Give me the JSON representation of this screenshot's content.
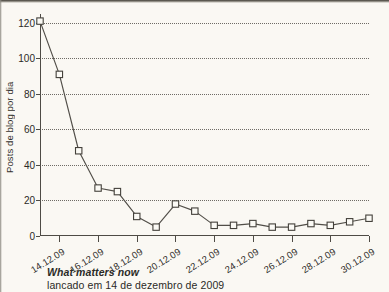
{
  "chart_data": {
    "type": "line",
    "title": "",
    "xlabel": "",
    "ylabel": "Posts de blog por dia",
    "ylim": [
      0,
      125
    ],
    "yticks": [
      0,
      20,
      40,
      60,
      80,
      100,
      120
    ],
    "ytick_labels": [
      "0",
      "20",
      "40",
      "60",
      "80",
      "100",
      "120"
    ],
    "grid": "horizontal dotted at y ticks",
    "legend": "none",
    "marker": "open square",
    "categories": [
      "13.12.09",
      "14.12.09",
      "15.12.09",
      "16.12.09",
      "17.12.09",
      "18.12.09",
      "19.12.09",
      "20.12.09",
      "21.12.09",
      "22.12.09",
      "23.12.09",
      "24.12.09",
      "25.12.09",
      "26.12.09",
      "27.12.09",
      "28.12.09",
      "29.12.09",
      "30.12.09"
    ],
    "xtick_labels": [
      "14.12.09",
      "16.12.09",
      "18.12.09",
      "20.12.09",
      "22.12.09",
      "24.12.09",
      "26.12.09",
      "28.12.09",
      "30.12.09"
    ],
    "values": [
      121,
      91,
      48,
      27,
      25,
      11,
      5,
      18,
      14,
      6,
      6,
      7,
      5,
      5,
      7,
      6,
      8,
      10
    ]
  },
  "caption": {
    "title": "What matters now",
    "subtitle": "lancado em 14 de dezembro de 2009"
  }
}
